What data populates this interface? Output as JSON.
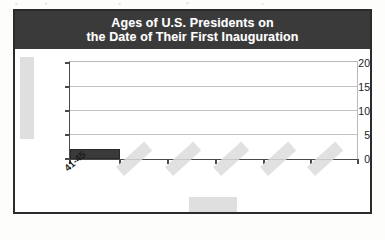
{
  "figure": {
    "title_line1": "Ages of U.S. Presidents on",
    "title_line2": "the Date of Their First Inauguration",
    "title_bg": "#3a3a3a",
    "frame_color": "#2b2b2b",
    "bar_color": "#3a3a3a",
    "gridline_color": "#c2c2c2",
    "redaction_color": "#dcdcdc"
  },
  "chart_data": {
    "type": "bar",
    "title": "Ages of U.S. Presidents on the Date of Their First Inauguration",
    "xlabel": "",
    "ylabel": "",
    "categories": [
      "41-45",
      "",
      "",
      "",
      "",
      ""
    ],
    "values": [
      2,
      0,
      0,
      0,
      0,
      0
    ],
    "ylim": [
      0,
      20
    ],
    "ytick_labels": [
      "0",
      "5",
      "10",
      "15",
      "20"
    ],
    "ytick_values": [
      0,
      5,
      10,
      15,
      20
    ],
    "grid": "horizontal",
    "legend": "none",
    "note": "Only the first category label (41-45) and its bar are visible; remaining x-axis labels, the y-axis title and the x-axis title are covered by grey redaction blocks."
  },
  "axis": {
    "y_ticks": [
      {
        "label": "20",
        "value": 20
      },
      {
        "label": "15",
        "value": 15
      },
      {
        "label": "10",
        "value": 10
      },
      {
        "label": "5",
        "value": 5
      },
      {
        "label": "0",
        "value": 0
      }
    ],
    "x_categories": [
      {
        "label": "41-45",
        "redacted": false
      },
      {
        "label": "",
        "redacted": true
      },
      {
        "label": "",
        "redacted": true
      },
      {
        "label": "",
        "redacted": true
      },
      {
        "label": "",
        "redacted": true
      },
      {
        "label": "",
        "redacted": true
      }
    ]
  },
  "redactions": {
    "y_axis_title": "",
    "x_axis_title": "",
    "x_category_labels": [
      "",
      "",
      "",
      "",
      ""
    ]
  }
}
